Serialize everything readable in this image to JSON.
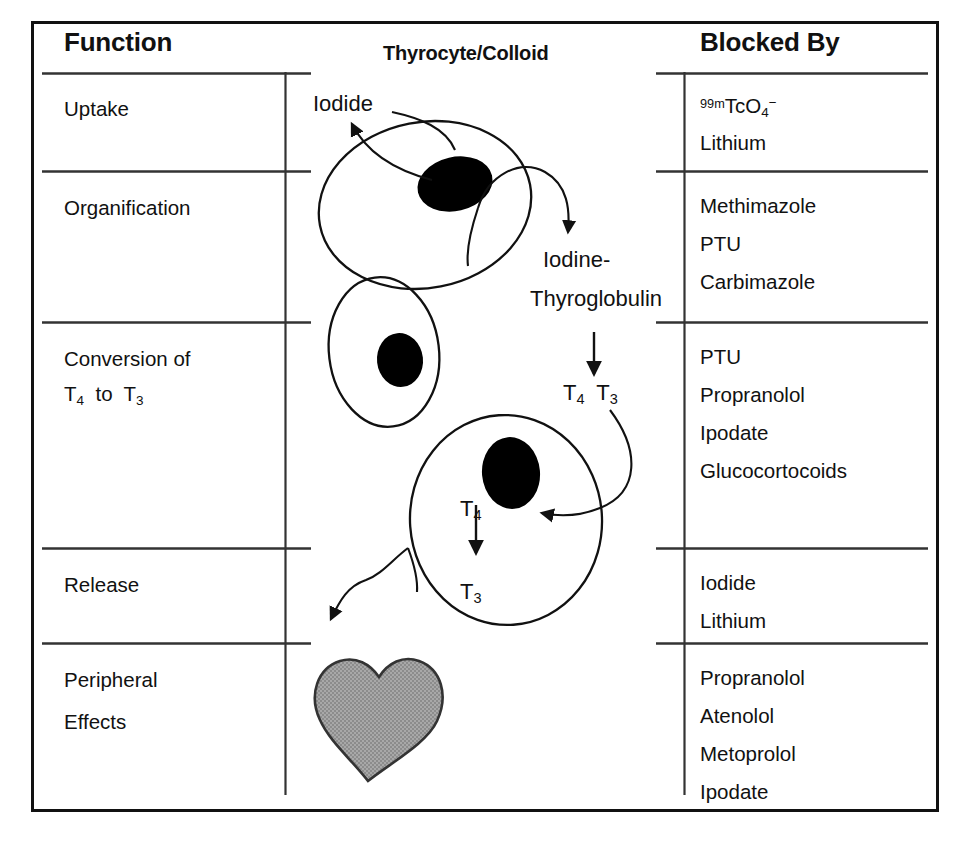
{
  "figure": {
    "title_columns": {
      "function": "Function",
      "middle": "Thyrocyte/Colloid",
      "blocked_by": "Blocked By"
    },
    "rows": [
      {
        "function": "Uptake",
        "blocked_by": [
          "99mTcO4-",
          "Lithium"
        ],
        "blocked_by_display": [
          "⁹⁹ᵐTcO₄⁻",
          "Lithium"
        ]
      },
      {
        "function": "Organification",
        "blocked_by": [
          "Methimazole",
          "PTU",
          "Carbimazole"
        ]
      },
      {
        "function_line1": "Conversion of",
        "function_line2": "T4 to T3",
        "blocked_by": [
          "PTU",
          "Propranolol",
          "Ipodate",
          "Glucocortocoids"
        ]
      },
      {
        "function": "Release",
        "blocked_by": [
          "Iodide",
          "Lithium"
        ]
      },
      {
        "function_line1": "Peripheral",
        "function_line2": "Effects",
        "blocked_by": [
          "Propranolol",
          "Atenolol",
          "Metoprolol",
          "Ipodate"
        ]
      }
    ],
    "diagram_labels": {
      "iodide": "Iodide",
      "iodine_thyroglobulin_line1": "Iodine-",
      "iodine_thyroglobulin_line2": "Thyroglobulin",
      "t4_t3_pair_t4": "T4",
      "t4_t3_pair_t3": "T3",
      "cell3_t4": "T4",
      "cell3_t3": "T3"
    },
    "colors": {
      "ink": "#111111",
      "rule": "#333333",
      "heart_fill": "#9a9a9a",
      "nucleus": "#000000",
      "background": "#ffffff"
    }
  }
}
